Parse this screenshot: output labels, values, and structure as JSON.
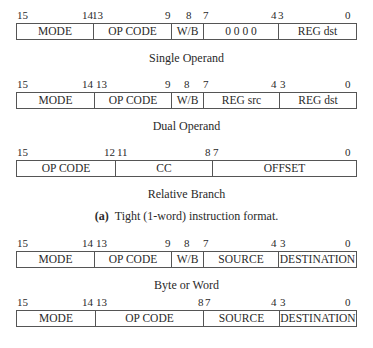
{
  "formats": [
    {
      "bits": [
        {
          "t": "15",
          "x": 17
        },
        {
          "t": "14",
          "x": 82
        },
        {
          "t": "13",
          "x": 92
        },
        {
          "t": "9",
          "x": 165
        },
        {
          "t": "8",
          "x": 186
        },
        {
          "t": "7",
          "x": 203
        },
        {
          "t": "4",
          "x": 271
        },
        {
          "t": "3",
          "x": 278
        },
        {
          "t": "0",
          "x": 345
        }
      ],
      "fields": [
        {
          "label": "MODE",
          "w": 76
        },
        {
          "label": "OP CODE",
          "w": 78
        },
        {
          "label": "W/B",
          "w": 32
        },
        {
          "label": "0 0 0 0",
          "w": 75
        },
        {
          "label": "REG dst",
          "w": 78
        }
      ],
      "caption": "Single Operand"
    },
    {
      "bits": [
        {
          "t": "15",
          "x": 17
        },
        {
          "t": "14",
          "x": 82
        },
        {
          "t": "13",
          "x": 96
        },
        {
          "t": "9",
          "x": 165
        },
        {
          "t": "8",
          "x": 184
        },
        {
          "t": "7",
          "x": 203
        },
        {
          "t": "4",
          "x": 271
        },
        {
          "t": "3",
          "x": 280
        },
        {
          "t": "0",
          "x": 345
        }
      ],
      "fields": [
        {
          "label": "MODE",
          "w": 77
        },
        {
          "label": "OP CODE",
          "w": 77
        },
        {
          "label": "W/B",
          "w": 32
        },
        {
          "label": "REG src",
          "w": 76
        },
        {
          "label": "REG dst",
          "w": 77
        }
      ],
      "caption": "Dual Operand"
    },
    {
      "bits": [
        {
          "t": "15",
          "x": 17
        },
        {
          "t": "12",
          "x": 104
        },
        {
          "t": "11",
          "x": 117
        },
        {
          "t": "8",
          "x": 205
        },
        {
          "t": "7",
          "x": 213
        },
        {
          "t": "0",
          "x": 345
        }
      ],
      "fields": [
        {
          "label": "OP CODE",
          "w": 98
        },
        {
          "label": "CC",
          "w": 97
        },
        {
          "label": "OFFSET",
          "w": 144
        }
      ],
      "caption": "Relative Branch"
    }
  ],
  "section_a_caption": {
    "label": "(a)",
    "text": "Tight (1-word) instruction format."
  },
  "formats_b": [
    {
      "bits": [
        {
          "t": "15",
          "x": 17
        },
        {
          "t": "14",
          "x": 82
        },
        {
          "t": "13",
          "x": 96
        },
        {
          "t": "9",
          "x": 165
        },
        {
          "t": "8",
          "x": 184
        },
        {
          "t": "7",
          "x": 203
        },
        {
          "t": "4",
          "x": 271
        },
        {
          "t": "3",
          "x": 280
        },
        {
          "t": "0",
          "x": 345
        }
      ],
      "fields": [
        {
          "label": "MODE",
          "w": 77
        },
        {
          "label": "OP CODE",
          "w": 77
        },
        {
          "label": "W/B",
          "w": 32
        },
        {
          "label": "SOURCE",
          "w": 75
        },
        {
          "label": "DESTINATION",
          "w": 78
        }
      ],
      "caption": "Byte or Word"
    },
    {
      "bits": [
        {
          "t": "15",
          "x": 17
        },
        {
          "t": "14",
          "x": 82
        },
        {
          "t": "13",
          "x": 96
        },
        {
          "t": "8",
          "x": 198
        },
        {
          "t": "7",
          "x": 205
        },
        {
          "t": "4",
          "x": 271
        },
        {
          "t": "3",
          "x": 280
        },
        {
          "t": "0",
          "x": 345
        }
      ],
      "fields": [
        {
          "label": "MODE",
          "w": 78
        },
        {
          "label": "OP CODE",
          "w": 108
        },
        {
          "label": "SOURCE",
          "w": 76
        },
        {
          "label": "DESTINATION",
          "w": 77
        }
      ],
      "caption": "Word"
    }
  ]
}
